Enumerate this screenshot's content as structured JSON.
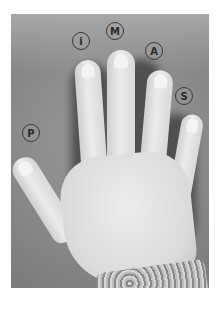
{
  "figure": {
    "labels": [
      {
        "id": "thumb",
        "letter": "P"
      },
      {
        "id": "index",
        "letter": "i"
      },
      {
        "id": "middle",
        "letter": "M"
      },
      {
        "id": "ring",
        "letter": "A"
      },
      {
        "id": "little",
        "letter": "S"
      }
    ]
  }
}
